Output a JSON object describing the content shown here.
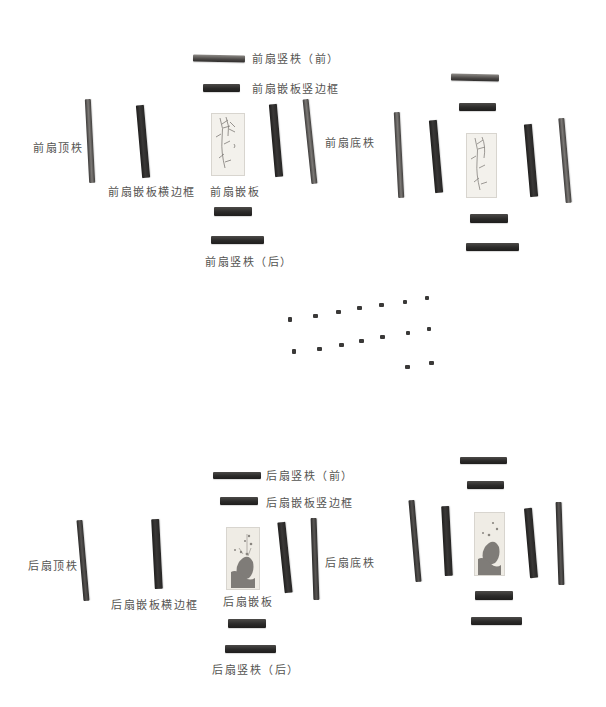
{
  "figure": {
    "type": "exploded-view of two door leaves (front and back) with joinery parts",
    "background": "#ffffff",
    "part_color": "#2f2d2c",
    "label_color": "#555452"
  },
  "front_leaf": {
    "labels": {
      "vertical_rail_front": "前扇竖柣（前）",
      "panel_vertical_frame": "前扇嵌板竖边框",
      "top_rail": "前扇顶柣",
      "panel_horizontal_frame": "前扇嵌板横边框",
      "panel": "前扇嵌板",
      "bottom_rail": "前扇底柣",
      "vertical_rail_back": "前扇竖柣（后）"
    }
  },
  "pegs": {
    "rows": [
      {
        "count": 7
      },
      {
        "count": 7
      },
      {
        "count": 2
      }
    ]
  },
  "back_leaf": {
    "labels": {
      "vertical_rail_front": "后扇竖柣（前）",
      "panel_vertical_frame": "后扇嵌板竖边框",
      "top_rail": "后扇顶柣",
      "panel_horizontal_frame": "后扇嵌板横边框",
      "panel": "后扇嵌板",
      "bottom_rail": "后扇底柣",
      "vertical_rail_back": "后扇竖柣（后）"
    }
  }
}
